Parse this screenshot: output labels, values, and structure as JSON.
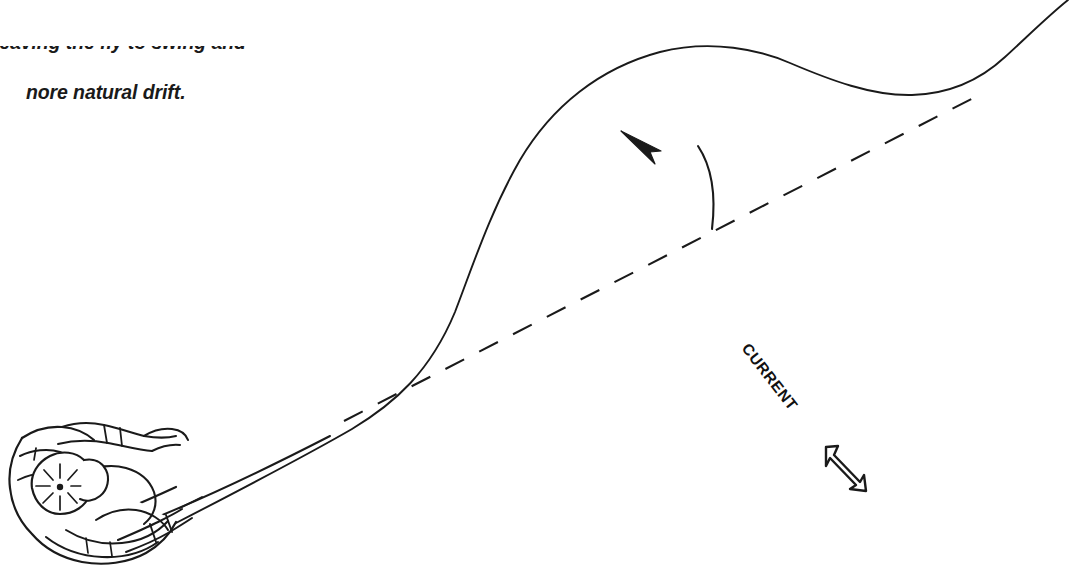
{
  "figure": {
    "kind": "line-drawing",
    "background_color": "#ffffff",
    "ink_color": "#1a1a1a",
    "width": 1080,
    "height": 572
  },
  "caption": {
    "clipped_line_above": "leaving the fly to swing and",
    "visible_line": "nore natural drift.",
    "full_visible_line_intended": "more natural drift.",
    "style": "bold italic"
  },
  "labels": {
    "current": "CURRENT",
    "current_rotation_degrees": 52
  },
  "annotations": {
    "mend_arrow_name": "mend-direction-arrow",
    "mend_arrow_description": "curved arrow pointing up-left toward the belly of the fly line",
    "current_arrow_name": "current-direction-arrow",
    "current_arrow_description": "hollow block arrow pointing down-right"
  },
  "elements": {
    "fly_line_label": "fly line with upstream mend",
    "reference_line_label": "straight dashed reference line",
    "hand_label": "angler hand gripping rod and reel",
    "reel_label": "fly reel with spokes",
    "rod_label": "fly rod"
  },
  "colors": {
    "ink": "#1a1a1a",
    "paper": "#ffffff",
    "caption": "#1a1a1a"
  }
}
